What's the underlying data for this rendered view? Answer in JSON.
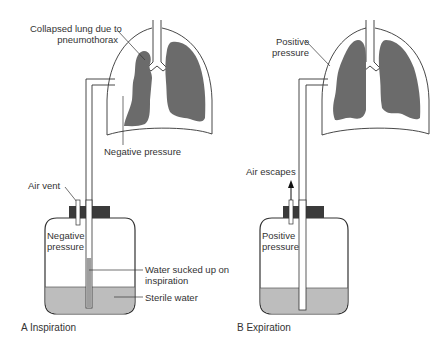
{
  "panels": {
    "a": {
      "caption": "A  Inspiration",
      "labels": {
        "collapsed_line1": "Collapsed lung due to",
        "collapsed_line2": "pneumothorax",
        "negative_pressure_chest": "Negative pressure",
        "air_vent": "Air vent",
        "negative_line1": "Negative",
        "negative_line2": "pressure",
        "water_sucked_line1": "Water sucked up on",
        "water_sucked_line2": "inspiration",
        "sterile_water": "Sterile water"
      }
    },
    "b": {
      "caption": "B  Expiration",
      "labels": {
        "positive_chest_line1": "Positive",
        "positive_chest_line2": "pressure",
        "air_escapes": "Air escapes",
        "positive_jar_line1": "Positive",
        "positive_jar_line2": "pressure"
      }
    }
  },
  "colors": {
    "lung": "#6b6b6b",
    "water": "#bdbdbd",
    "cap": "#3a3a3a",
    "outline": "#333333"
  }
}
